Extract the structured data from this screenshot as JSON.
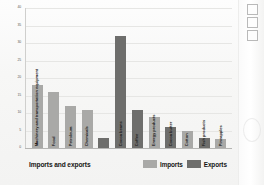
{
  "chart_data": {
    "type": "bar",
    "title": "",
    "xlabel": "Imports and exports",
    "ylabel": "Percentage of total",
    "ylim": [
      0,
      40
    ],
    "yticks": [
      0,
      5,
      10,
      15,
      20,
      25,
      30,
      35,
      40
    ],
    "ytick_labels": [
      "0",
      "5",
      "10",
      "15",
      "20",
      "25",
      "30",
      "35",
      "40"
    ],
    "grid": true,
    "legend_position": "bottom-right",
    "categories": [
      "Machinery and transportation equipment",
      "Food",
      "Petroleum",
      "Chemicals",
      "Cocoa beans",
      "Coffee",
      "Energy products",
      "Cocoa butter",
      "Cotton",
      "Fish products",
      "Pineapples"
    ],
    "series": [
      {
        "name": "Imports",
        "color": "#a9a9a7",
        "values": [
          18,
          16,
          12,
          11,
          null,
          null,
          9,
          null,
          5,
          null,
          2.5
        ]
      },
      {
        "name": "Exports",
        "color": "#6e6e6c",
        "values": [
          null,
          null,
          null,
          3,
          32,
          11,
          null,
          6,
          null,
          3,
          null
        ]
      }
    ],
    "bars": [
      {
        "label": "Machinery and transportation equipment",
        "series": "Imports",
        "value": 18
      },
      {
        "label": "Food",
        "series": "Imports",
        "value": 16
      },
      {
        "label": "Petroleum",
        "series": "Imports",
        "value": 12
      },
      {
        "label": "Chemicals",
        "series": "Imports",
        "value": 11
      },
      {
        "label": "",
        "series": "Exports",
        "value": 3
      },
      {
        "label": "Cocoa beans",
        "series": "Exports",
        "value": 32
      },
      {
        "label": "Coffee",
        "series": "Exports",
        "value": 11
      },
      {
        "label": "Energy products",
        "series": "Imports",
        "value": 9
      },
      {
        "label": "Cocoa butter",
        "series": "Exports",
        "value": 6
      },
      {
        "label": "Cotton",
        "series": "Imports",
        "value": 5
      },
      {
        "label": "Fish products",
        "series": "Exports",
        "value": 3
      },
      {
        "label": "Pineapples",
        "series": "Imports",
        "value": 2.5
      }
    ]
  },
  "axes": {
    "y_title": "Percentage of total",
    "x_title": "Imports and exports"
  },
  "legend": {
    "imports_label": "Imports",
    "exports_label": "Exports"
  },
  "colors": {
    "imports": "#a9a9a7",
    "exports": "#6e6e6c",
    "grid": "#e6e6e4",
    "axis": "#b5b5b3",
    "text": "#151513"
  }
}
